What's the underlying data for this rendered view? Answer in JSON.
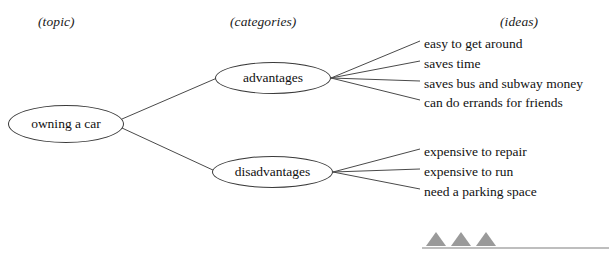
{
  "headers": [
    {
      "label": "(topic)",
      "x": 38,
      "y": 14
    },
    {
      "label": "(categories)",
      "x": 230,
      "y": 14
    },
    {
      "label": "(ideas)",
      "x": 500,
      "y": 14
    }
  ],
  "topic": {
    "label": "owning a car",
    "x": 8,
    "y": 105,
    "w": 116,
    "h": 38
  },
  "categories": [
    {
      "label": "advantages",
      "x": 215,
      "y": 62,
      "w": 116,
      "h": 32
    },
    {
      "label": "disadvantages",
      "x": 212,
      "y": 156,
      "w": 121,
      "h": 32
    }
  ],
  "ideas": {
    "advantages": [
      {
        "label": "easy to get around",
        "x": 424,
        "y": 37
      },
      {
        "label": "saves time",
        "x": 424,
        "y": 57
      },
      {
        "label": "saves bus and subway money",
        "x": 424,
        "y": 77
      },
      {
        "label": "can do errands for friends",
        "x": 424,
        "y": 96
      }
    ],
    "disadvantages": [
      {
        "label": "expensive to repair",
        "x": 424,
        "y": 145
      },
      {
        "label": "expensive to run",
        "x": 424,
        "y": 165
      },
      {
        "label": "need a parking space",
        "x": 424,
        "y": 185
      }
    ]
  },
  "connectors": {
    "topic_to_categories": [
      {
        "x1": 122,
        "y1": 119,
        "x2": 217,
        "y2": 78
      },
      {
        "x1": 122,
        "y1": 128,
        "x2": 215,
        "y2": 171
      }
    ],
    "advantages_to_ideas": [
      {
        "x1": 331,
        "y1": 78,
        "x2": 420,
        "y2": 41
      },
      {
        "x1": 331,
        "y1": 78,
        "x2": 420,
        "y2": 61
      },
      {
        "x1": 331,
        "y1": 78,
        "x2": 420,
        "y2": 81
      },
      {
        "x1": 331,
        "y1": 78,
        "x2": 420,
        "y2": 100
      }
    ],
    "disadvantages_to_ideas": [
      {
        "x1": 333,
        "y1": 172,
        "x2": 420,
        "y2": 149
      },
      {
        "x1": 333,
        "y1": 172,
        "x2": 420,
        "y2": 169
      },
      {
        "x1": 333,
        "y1": 172,
        "x2": 420,
        "y2": 189
      }
    ]
  },
  "footer_mark": {
    "name": "three-triangles-on-rule",
    "x": 420,
    "y": 228,
    "w": 190,
    "h": 24,
    "triangle_color": "#9a9a9a",
    "rule_color": "#a9a9a9",
    "triangles": [
      {
        "cx": 436,
        "base_w": 20,
        "h": 14
      },
      {
        "cx": 461,
        "base_w": 20,
        "h": 14
      },
      {
        "cx": 486,
        "base_w": 20,
        "h": 14
      }
    ],
    "rule": {
      "x1": 422,
      "x2": 609,
      "y": 248
    }
  },
  "style": {
    "line_color": "#4a4a4a",
    "node_stroke": "#3a3a3a",
    "background": "#ffffff"
  }
}
